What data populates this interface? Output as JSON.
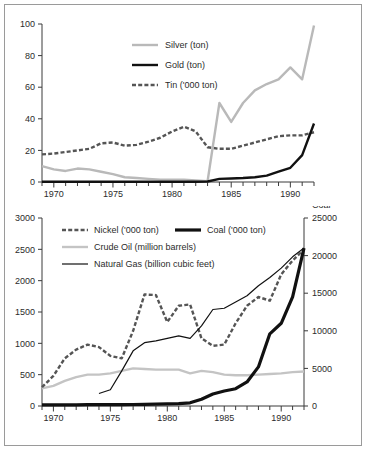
{
  "figure": {
    "background_color": "#ffffff",
    "border_color": "#9a9a9a"
  },
  "colors": {
    "silver_series": "#b9b9b9",
    "gold_series": "#111111",
    "tin_series": "#555555",
    "nickel_series": "#555555",
    "crude_oil_series": "#c4c4c4",
    "natural_gas_series": "#111111",
    "coal_series": "#111111",
    "axis": "#3a3a3a",
    "text": "#2b2b2b"
  },
  "chart_data": [
    {
      "id": "top-chart",
      "type": "line",
      "title": "",
      "xlabel": "",
      "ylabel": "",
      "xlim": [
        1969,
        1992
      ],
      "ylim": [
        0,
        100
      ],
      "yticks": [
        0,
        20,
        40,
        60,
        80,
        100
      ],
      "xticks": [
        1970,
        1975,
        1980,
        1985,
        1990
      ],
      "xtick_labels": [
        "1970",
        "1975",
        "1980",
        "1985",
        "1990"
      ],
      "ytick_labels": [
        "0",
        "20",
        "40",
        "60",
        "80",
        "100"
      ],
      "minor_xticks_every": 1,
      "grid": false,
      "legend_position": "upper-center-left",
      "x": [
        1969,
        1970,
        1971,
        1972,
        1973,
        1974,
        1975,
        1976,
        1977,
        1978,
        1979,
        1980,
        1981,
        1982,
        1983,
        1984,
        1985,
        1986,
        1987,
        1988,
        1989,
        1990,
        1991,
        1992
      ],
      "series": [
        {
          "name": "Silver (ton)",
          "style": "solid-thick",
          "color": "#b9b9b9",
          "values": [
            10.0,
            8.0,
            7.0,
            8.5,
            8.0,
            6.5,
            5.0,
            3.0,
            2.5,
            2.0,
            1.5,
            1.5,
            1.5,
            1.0,
            0.5,
            50.0,
            38.0,
            50.0,
            58.0,
            62.0,
            65.0,
            72.5,
            65.0,
            99.0
          ]
        },
        {
          "name": "Gold (ton)",
          "style": "solid-thick",
          "color": "#111111",
          "values": [
            0.2,
            0.2,
            0.2,
            0.2,
            0.2,
            0.2,
            0.2,
            0.2,
            0.2,
            0.2,
            0.2,
            0.2,
            0.2,
            0.2,
            0.3,
            2.0,
            2.2,
            2.5,
            3.0,
            4.0,
            6.5,
            9.0,
            17.0,
            37.0
          ]
        },
        {
          "name": "Tin ('000 ton)",
          "style": "dashed-thick",
          "color": "#555555",
          "values": [
            17.5,
            18.0,
            19.0,
            20.0,
            21.0,
            24.5,
            25.0,
            23.0,
            23.5,
            25.5,
            28.0,
            32.0,
            35.0,
            32.0,
            22.0,
            21.0,
            21.0,
            23.0,
            25.0,
            27.0,
            29.0,
            29.5,
            29.5,
            31.5
          ]
        }
      ]
    },
    {
      "id": "bottom-chart",
      "type": "line",
      "title": "",
      "xlabel": "",
      "ylabel": "",
      "secondary_axis_title": "Coal",
      "xlim": [
        1969,
        1992
      ],
      "ylim": [
        0,
        3000
      ],
      "y2lim": [
        0,
        25000
      ],
      "yticks": [
        0,
        500,
        1000,
        1500,
        2000,
        2500,
        3000
      ],
      "ytick_labels": [
        "0",
        "500",
        "1000",
        "1500",
        "2000",
        "2500",
        "3000"
      ],
      "y2ticks": [
        0,
        5000,
        10000,
        15000,
        20000,
        25000
      ],
      "y2tick_labels": [
        "0",
        "5000",
        "10000",
        "15000",
        "20000",
        "25000"
      ],
      "xticks": [
        1970,
        1975,
        1980,
        1985,
        1990
      ],
      "xtick_labels": [
        "1970",
        "1975",
        "1980",
        "1985",
        "1990"
      ],
      "minor_xticks_every": 1,
      "grid": false,
      "legend_position": "upper-left-and-upper-right",
      "x": [
        1969,
        1970,
        1971,
        1972,
        1973,
        1974,
        1975,
        1976,
        1977,
        1978,
        1979,
        1980,
        1981,
        1982,
        1983,
        1984,
        1985,
        1986,
        1987,
        1988,
        1989,
        1990,
        1991,
        1992
      ],
      "series": [
        {
          "name": "Nickel ('000 ton)",
          "style": "dashed-thick",
          "color": "#555555",
          "axis": "left",
          "values": [
            300,
            480,
            760,
            900,
            980,
            940,
            800,
            760,
            1200,
            1780,
            1770,
            1340,
            1600,
            1620,
            1080,
            960,
            980,
            1320,
            1600,
            1740,
            1680,
            2100,
            2320,
            2500
          ]
        },
        {
          "name": "Crude Oil (million barrels)",
          "style": "solid-thick",
          "color": "#c4c4c4",
          "axis": "left",
          "values": [
            280,
            320,
            400,
            460,
            500,
            500,
            520,
            560,
            600,
            590,
            580,
            580,
            580,
            520,
            560,
            540,
            500,
            490,
            490,
            500,
            510,
            520,
            540,
            550
          ]
        },
        {
          "name": "Natural Gas (billion cubic feet)",
          "style": "solid-thin",
          "color": "#111111",
          "axis": "left",
          "start_year": 1974,
          "values": [
            null,
            null,
            null,
            null,
            null,
            200,
            260,
            560,
            880,
            1010,
            1040,
            1080,
            1120,
            1080,
            1280,
            1540,
            1560,
            1660,
            1760,
            1920,
            2050,
            2200,
            2380,
            2520
          ]
        },
        {
          "name": "Coal ('000 ton)",
          "style": "solid-extra-thick",
          "color": "#111111",
          "axis": "right",
          "values": [
            150,
            150,
            160,
            160,
            170,
            180,
            180,
            190,
            200,
            220,
            240,
            280,
            320,
            420,
            900,
            1600,
            2000,
            2300,
            3200,
            5200,
            9600,
            11000,
            14500,
            21000
          ]
        }
      ]
    }
  ],
  "top_legend": {
    "items": [
      {
        "label": "Silver (ton)",
        "marker": "solid-thick",
        "color": "#b9b9b9"
      },
      {
        "label": "Gold (ton)",
        "marker": "solid-thick",
        "color": "#111111"
      },
      {
        "label": "Tin ('000 ton)",
        "marker": "dashed-thick",
        "color": "#555555"
      }
    ]
  },
  "bottom_legend": {
    "left_items": [
      {
        "label": "Nickel ('000 ton)",
        "marker": "dashed-thick",
        "color": "#555555"
      },
      {
        "label": "Crude Oil (million barrels)",
        "marker": "solid-thick",
        "color": "#c4c4c4"
      },
      {
        "label": "Natural Gas (billion cubic feet)",
        "marker": "solid-thin",
        "color": "#111111"
      }
    ],
    "right_items": [
      {
        "label": "Coal ('000 ton)",
        "marker": "solid-extra-thick",
        "color": "#111111"
      }
    ]
  }
}
